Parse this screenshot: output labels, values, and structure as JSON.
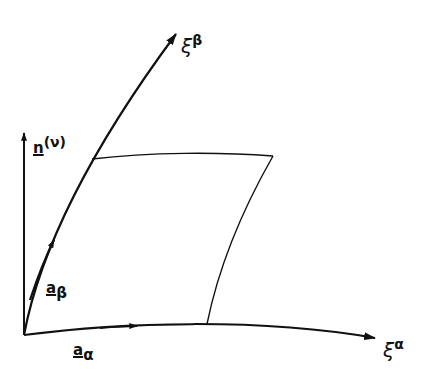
{
  "diagram": {
    "axes": {
      "xi_beta": {
        "symbol": "ξ",
        "superscript": "β"
      },
      "xi_alpha": {
        "symbol": "ξ",
        "superscript": "α"
      }
    },
    "normal": {
      "symbol": "n",
      "superscript": "(ν)"
    },
    "base_vectors": {
      "a_beta": {
        "symbol": "a",
        "subscript": "β"
      },
      "a_alpha": {
        "symbol": "a",
        "subscript": "α"
      }
    },
    "colors": {
      "line": "#111111",
      "background": "#ffffff"
    }
  }
}
